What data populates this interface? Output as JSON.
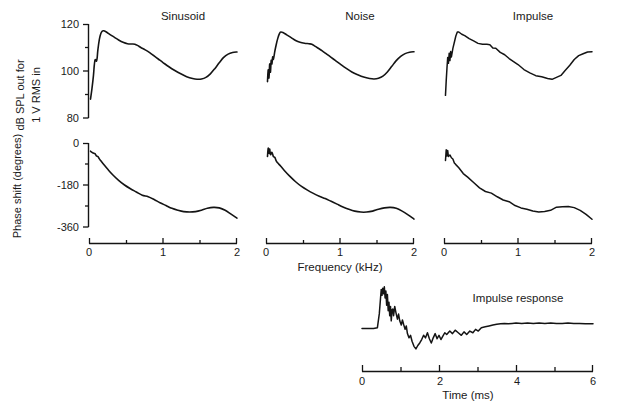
{
  "figure": {
    "panel_titles": [
      "Sinusoid",
      "Noise",
      "Impulse"
    ],
    "impulse_title": "Impulse response",
    "axis_titles": {
      "frequency": "Frequency (kHz)",
      "time": "Time (ms)",
      "magnitude_line1": "dB SPL out for",
      "magnitude_line2": "1 V RMS in",
      "phase": "Phase shift (degrees)"
    },
    "tick_labels": {
      "magnitude_y": [
        "120",
        "100",
        "80"
      ],
      "phase_y": [
        "0",
        "-180",
        "-360"
      ],
      "frequency_x": [
        "0",
        "1",
        "2"
      ],
      "time_x": [
        "0",
        "2",
        "4",
        "6"
      ]
    },
    "colors": {
      "ink": "#141414",
      "background": "#ffffff"
    }
  },
  "chart_data": [
    {
      "type": "line",
      "title": "Sinusoid",
      "subtitle": "magnitude",
      "xlabel": "Frequency (kHz)",
      "ylabel": "dB SPL out for 1 V RMS in",
      "xlim": [
        0,
        2
      ],
      "ylim": [
        80,
        120
      ],
      "xticks": [
        0,
        0.5,
        1,
        1.5,
        2
      ],
      "xticklabels": [
        "0",
        "",
        "1",
        "",
        "2"
      ],
      "yticks": [
        80,
        90,
        100,
        110,
        120
      ],
      "yticklabels": [
        "80",
        "",
        "100",
        "",
        "120"
      ],
      "grid": false,
      "legend": "none",
      "x": [
        0.02,
        0.04,
        0.06,
        0.07,
        0.08,
        0.09,
        0.1,
        0.11,
        0.12,
        0.14,
        0.16,
        0.18,
        0.2,
        0.24,
        0.28,
        0.34,
        0.4,
        0.46,
        0.52,
        0.58,
        0.62,
        0.66,
        0.7,
        0.76,
        0.82,
        0.88,
        0.94,
        1.0,
        1.08,
        1.16,
        1.24,
        1.32,
        1.4,
        1.46,
        1.52,
        1.58,
        1.64,
        1.7,
        1.76,
        1.82,
        1.88,
        1.94,
        2.0
      ],
      "y": [
        88.0,
        92.5,
        98.0,
        102.0,
        104.5,
        104.8,
        104.2,
        105.5,
        109.0,
        113.5,
        116.0,
        117.0,
        117.1,
        116.5,
        115.6,
        114.4,
        113.2,
        112.2,
        111.6,
        111.5,
        111.4,
        110.8,
        110.0,
        109.0,
        107.8,
        106.4,
        105.0,
        103.6,
        101.8,
        100.2,
        98.8,
        97.6,
        96.8,
        96.5,
        96.6,
        97.3,
        98.8,
        101.0,
        103.5,
        105.8,
        107.2,
        107.9,
        108.1
      ]
    },
    {
      "type": "line",
      "title": "Noise",
      "subtitle": "magnitude",
      "xlabel": "Frequency (kHz)",
      "ylabel": "dB SPL out for 1 V RMS in",
      "xlim": [
        0,
        2
      ],
      "ylim": [
        80,
        120
      ],
      "grid": false,
      "legend": "none",
      "x": [
        0.02,
        0.03,
        0.04,
        0.05,
        0.06,
        0.07,
        0.08,
        0.09,
        0.1,
        0.12,
        0.14,
        0.16,
        0.18,
        0.2,
        0.24,
        0.28,
        0.34,
        0.4,
        0.46,
        0.52,
        0.58,
        0.62,
        0.66,
        0.7,
        0.76,
        0.82,
        0.88,
        0.94,
        1.0,
        1.08,
        1.16,
        1.24,
        1.32,
        1.4,
        1.46,
        1.52,
        1.58,
        1.64,
        1.7,
        1.76,
        1.82,
        1.88,
        1.94,
        2.0
      ],
      "y": [
        95.5,
        100.5,
        97.0,
        103.0,
        99.5,
        104.5,
        103.0,
        106.0,
        105.0,
        108.5,
        111.5,
        114.0,
        115.8,
        116.6,
        116.2,
        115.4,
        114.2,
        113.0,
        112.2,
        111.8,
        111.6,
        111.4,
        110.6,
        109.8,
        108.6,
        107.2,
        105.8,
        104.4,
        103.0,
        101.2,
        99.6,
        98.4,
        97.4,
        96.8,
        96.6,
        96.9,
        97.8,
        99.6,
        102.0,
        104.4,
        106.2,
        107.4,
        108.0,
        108.2
      ]
    },
    {
      "type": "line",
      "title": "Impulse",
      "subtitle": "magnitude",
      "xlabel": "Frequency (kHz)",
      "ylabel": "dB SPL out for 1 V RMS in",
      "xlim": [
        0,
        2
      ],
      "ylim": [
        80,
        120
      ],
      "grid": false,
      "legend": "none",
      "noisy": true,
      "x": [
        0.02,
        0.03,
        0.04,
        0.05,
        0.06,
        0.07,
        0.08,
        0.09,
        0.1,
        0.12,
        0.14,
        0.16,
        0.18,
        0.2,
        0.24,
        0.28,
        0.34,
        0.4,
        0.46,
        0.52,
        0.58,
        0.62,
        0.66,
        0.7,
        0.76,
        0.82,
        0.88,
        0.94,
        1.0,
        1.08,
        1.16,
        1.24,
        1.32,
        1.4,
        1.46,
        1.52,
        1.58,
        1.64,
        1.7,
        1.76,
        1.82,
        1.88,
        1.94,
        2.0
      ],
      "y": [
        90.0,
        96.0,
        101.0,
        106.0,
        103.0,
        107.5,
        104.5,
        108.0,
        106.0,
        109.5,
        112.5,
        115.0,
        116.4,
        116.9,
        116.0,
        115.0,
        113.6,
        112.6,
        112.0,
        111.6,
        111.4,
        111.0,
        110.2,
        109.4,
        108.2,
        106.8,
        105.4,
        104.0,
        102.6,
        100.8,
        99.2,
        98.0,
        97.2,
        96.8,
        96.7,
        97.2,
        98.4,
        100.4,
        102.6,
        104.8,
        106.4,
        107.4,
        107.9,
        108.1
      ]
    },
    {
      "type": "line",
      "title": "Sinusoid",
      "subtitle": "phase",
      "xlabel": "Frequency (kHz)",
      "ylabel": "Phase shift (degrees)",
      "xlim": [
        0,
        2
      ],
      "ylim": [
        -360,
        0
      ],
      "yticks": [
        -360,
        -270,
        -180,
        -90,
        0
      ],
      "yticklabels": [
        "-360",
        "",
        "-180",
        "",
        "0"
      ],
      "grid": false,
      "legend": "none",
      "x": [
        0.02,
        0.05,
        0.08,
        0.1,
        0.12,
        0.14,
        0.16,
        0.2,
        0.26,
        0.32,
        0.4,
        0.48,
        0.56,
        0.64,
        0.72,
        0.8,
        0.88,
        0.96,
        1.04,
        1.12,
        1.2,
        1.28,
        1.36,
        1.44,
        1.52,
        1.6,
        1.68,
        1.76,
        1.84,
        1.92,
        2.0
      ],
      "y": [
        -35,
        -42,
        -46,
        -55,
        -58,
        -68,
        -76,
        -92,
        -115,
        -136,
        -160,
        -180,
        -196,
        -210,
        -224,
        -230,
        -242,
        -256,
        -268,
        -280,
        -288,
        -294,
        -296,
        -294,
        -288,
        -280,
        -276,
        -278,
        -288,
        -305,
        -322
      ]
    },
    {
      "type": "line",
      "title": "Noise",
      "subtitle": "phase",
      "xlabel": "Frequency (kHz)",
      "ylabel": "Phase shift (degrees)",
      "xlim": [
        0,
        2
      ],
      "ylim": [
        -360,
        0
      ],
      "grid": false,
      "legend": "none",
      "x": [
        0.02,
        0.03,
        0.04,
        0.05,
        0.06,
        0.08,
        0.1,
        0.12,
        0.14,
        0.16,
        0.2,
        0.26,
        0.32,
        0.4,
        0.48,
        0.56,
        0.64,
        0.72,
        0.8,
        0.88,
        0.96,
        1.04,
        1.12,
        1.2,
        1.28,
        1.36,
        1.44,
        1.52,
        1.6,
        1.68,
        1.76,
        1.84,
        1.92,
        2.0
      ],
      "y": [
        -58,
        -22,
        -44,
        -26,
        -50,
        -40,
        -58,
        -62,
        -78,
        -86,
        -100,
        -122,
        -142,
        -166,
        -186,
        -202,
        -216,
        -228,
        -238,
        -250,
        -262,
        -274,
        -284,
        -292,
        -296,
        -296,
        -292,
        -284,
        -278,
        -276,
        -280,
        -292,
        -308,
        -326
      ]
    },
    {
      "type": "line",
      "title": "Impulse",
      "subtitle": "phase",
      "xlabel": "Frequency (kHz)",
      "ylabel": "Phase shift (degrees)",
      "xlim": [
        0,
        2
      ],
      "ylim": [
        -360,
        0
      ],
      "grid": false,
      "legend": "none",
      "noisy": true,
      "x": [
        0.02,
        0.03,
        0.04,
        0.05,
        0.06,
        0.08,
        0.1,
        0.12,
        0.14,
        0.16,
        0.2,
        0.26,
        0.32,
        0.4,
        0.48,
        0.56,
        0.64,
        0.72,
        0.8,
        0.88,
        0.96,
        1.04,
        1.12,
        1.2,
        1.28,
        1.36,
        1.44,
        1.52,
        1.6,
        1.68,
        1.76,
        1.84,
        1.92,
        2.0
      ],
      "y": [
        -72,
        -30,
        -52,
        -34,
        -56,
        -48,
        -66,
        -72,
        -84,
        -94,
        -108,
        -128,
        -148,
        -170,
        -190,
        -206,
        -218,
        -230,
        -242,
        -254,
        -266,
        -276,
        -286,
        -292,
        -294,
        -292,
        -286,
        -278,
        -272,
        -270,
        -274,
        -288,
        -306,
        -324
      ]
    },
    {
      "type": "line",
      "title": "Impulse response",
      "xlabel": "Time (ms)",
      "ylabel": "",
      "xlim": [
        0,
        6
      ],
      "ylim": [
        -1,
        1
      ],
      "xticks": [
        0,
        1,
        2,
        3,
        4,
        5,
        6
      ],
      "xticklabels": [
        "0",
        "",
        "2",
        "",
        "4",
        "",
        "6"
      ],
      "grid": false,
      "legend": "none",
      "x": [
        0.0,
        0.1,
        0.2,
        0.3,
        0.4,
        0.45,
        0.48,
        0.5,
        0.52,
        0.54,
        0.56,
        0.58,
        0.6,
        0.62,
        0.64,
        0.66,
        0.68,
        0.7,
        0.72,
        0.74,
        0.76,
        0.78,
        0.8,
        0.82,
        0.85,
        0.88,
        0.92,
        0.95,
        0.98,
        1.02,
        1.05,
        1.08,
        1.12,
        1.15,
        1.18,
        1.22,
        1.26,
        1.3,
        1.35,
        1.4,
        1.45,
        1.5,
        1.55,
        1.6,
        1.65,
        1.7,
        1.75,
        1.8,
        1.85,
        1.9,
        1.95,
        2.0,
        2.05,
        2.1,
        2.15,
        2.2,
        2.28,
        2.35,
        2.42,
        2.5,
        2.58,
        2.65,
        2.72,
        2.8,
        2.88,
        2.95,
        3.02,
        3.1,
        3.2,
        3.3,
        3.4,
        3.5,
        3.6,
        3.7,
        3.8,
        3.9,
        4.0,
        4.15,
        4.3,
        4.45,
        4.6,
        4.75,
        4.9,
        5.05,
        5.2,
        5.35,
        5.5,
        5.65,
        5.8,
        6.0
      ],
      "y": [
        0.0,
        0.0,
        0.0,
        0.0,
        0.02,
        0.35,
        0.7,
        0.92,
        0.78,
        0.95,
        0.82,
        0.98,
        0.72,
        0.88,
        0.55,
        0.8,
        0.42,
        0.62,
        0.3,
        0.52,
        0.18,
        0.44,
        0.46,
        0.3,
        0.52,
        0.38,
        0.22,
        0.34,
        0.18,
        0.08,
        0.2,
        0.1,
        -0.02,
        0.06,
        -0.12,
        -0.22,
        -0.16,
        -0.3,
        -0.42,
        -0.48,
        -0.4,
        -0.34,
        -0.26,
        -0.16,
        -0.22,
        -0.1,
        -0.24,
        -0.34,
        -0.22,
        -0.12,
        -0.24,
        -0.16,
        -0.26,
        -0.18,
        -0.1,
        -0.14,
        -0.06,
        -0.12,
        -0.04,
        -0.1,
        -0.16,
        -0.08,
        -0.14,
        -0.06,
        -0.1,
        -0.02,
        -0.06,
        0.02,
        0.04,
        0.06,
        0.08,
        0.1,
        0.11,
        0.12,
        0.11,
        0.12,
        0.13,
        0.12,
        0.13,
        0.12,
        0.13,
        0.12,
        0.13,
        0.12,
        0.12,
        0.13,
        0.12,
        0.12,
        0.11,
        0.11,
        0.1
      ]
    }
  ]
}
